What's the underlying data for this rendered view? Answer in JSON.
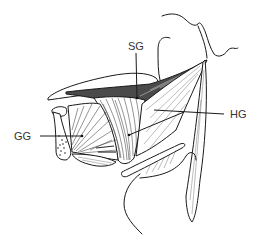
{
  "diagram": {
    "type": "anatomical line illustration",
    "labels": [
      {
        "id": "SG",
        "text": "SG",
        "x": 135,
        "y": 47,
        "pointer_to": [
          137,
          98
        ]
      },
      {
        "id": "HG",
        "text": "HG",
        "x": 230,
        "y": 118,
        "pointer_to": [
          128,
          135
        ]
      },
      {
        "id": "GG",
        "text": "GG",
        "x": 15,
        "y": 140,
        "pointer_to": [
          82,
          136
        ]
      }
    ]
  }
}
